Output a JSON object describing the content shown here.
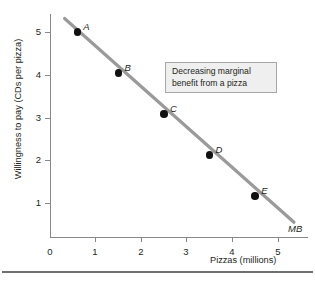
{
  "chart_data": {
    "type": "line",
    "title": "",
    "xlabel": "Pizzas (millions)",
    "ylabel": "Willingness to pay (CDs per pizza)",
    "xlim": [
      0,
      5.6
    ],
    "ylim": [
      0,
      5.6
    ],
    "xticks": [
      "0",
      "1",
      "2",
      "3",
      "4",
      "5"
    ],
    "yticks": [
      "1",
      "2",
      "3",
      "4",
      "5"
    ],
    "grid": false,
    "legend": "none",
    "series": [
      {
        "name": "MB",
        "label": "MB",
        "color": "#9a9a9a",
        "line_from": [
          0.32,
          5.33
        ],
        "line_to": [
          5.35,
          0.36
        ],
        "points": [
          {
            "label": "A",
            "x": 0.6,
            "y": 5
          },
          {
            "label": "B",
            "x": 1.5,
            "y": 4
          },
          {
            "label": "C",
            "x": 2.5,
            "y": 3
          },
          {
            "label": "D",
            "x": 3.5,
            "y": 2
          },
          {
            "label": "E",
            "x": 4.5,
            "y": 1
          }
        ]
      }
    ],
    "annotations": [
      {
        "name": "decreasing-marginal-benefit",
        "line1": "Decreasing marginal",
        "line2": "benefit from a pizza"
      }
    ]
  },
  "colors": {
    "line": "#9a9a9a",
    "axis": "#8a8a8a",
    "point": "#111111",
    "text": "#231f20",
    "callout_fill": "#efefef",
    "callout_border": "#a8a8a8",
    "rule": "#6f6f6f"
  }
}
